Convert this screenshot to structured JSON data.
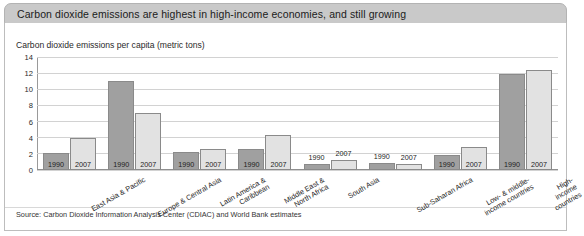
{
  "header": {
    "title": "Carbon dioxide emissions are highest in high-income economies, and still growing"
  },
  "subtitle": "Carbon dioxide emissions per capita (metric tons)",
  "source": "Source: Carbon Dioxide Information Analysis Center (CDIAC) and World Bank estimates",
  "colors": {
    "header_band": "#c9c9c9",
    "bar_1990": "#a0a0a0",
    "bar_2007": "#e2e2e2",
    "bar_border": "#8a8a8a",
    "gridline": "#d2d2d2",
    "panel_border": "#bdbdbd"
  },
  "chart_data": {
    "type": "bar",
    "title": "Carbon dioxide emissions are highest in high-income economies, and still growing",
    "subtitle": "Carbon dioxide emissions per capita (metric tons)",
    "xlabel": "",
    "ylabel": "Carbon dioxide emissions per capita (metric tons)",
    "ylim": [
      0,
      14
    ],
    "yticks": [
      0,
      2,
      4,
      6,
      8,
      10,
      12,
      14
    ],
    "ytick_labels": [
      "0",
      "2",
      "4",
      "6",
      "8",
      "10",
      "12",
      "14"
    ],
    "grid": true,
    "legend": "none",
    "bar_labels": [
      "1990",
      "2007"
    ],
    "categories": [
      "East Asia & Pacific",
      "Europe & Central Asia",
      "Latin America & Caribbean",
      "Middle East & North Africa",
      "South Asia",
      "Sub-Saharan Africa",
      "Low- & middle-income countries",
      "High-income countries"
    ],
    "category_lines": [
      [
        "East Asia & Pacific"
      ],
      [
        "Europe & Central Asia"
      ],
      [
        "Latin America &",
        "Caribbean"
      ],
      [
        "Middle East &",
        "North Africa"
      ],
      [
        "South Asia"
      ],
      [
        "Sub-Saharan Africa"
      ],
      [
        "Low- & middle-",
        "income countries"
      ],
      [
        "High-income countries"
      ]
    ],
    "series": [
      {
        "name": "1990",
        "values": [
          2.1,
          11.0,
          2.2,
          2.6,
          0.7,
          0.9,
          1.9,
          11.9
        ]
      },
      {
        "name": "2007",
        "values": [
          4.0,
          7.1,
          2.6,
          4.3,
          1.3,
          0.8,
          2.8,
          12.4
        ]
      }
    ]
  }
}
